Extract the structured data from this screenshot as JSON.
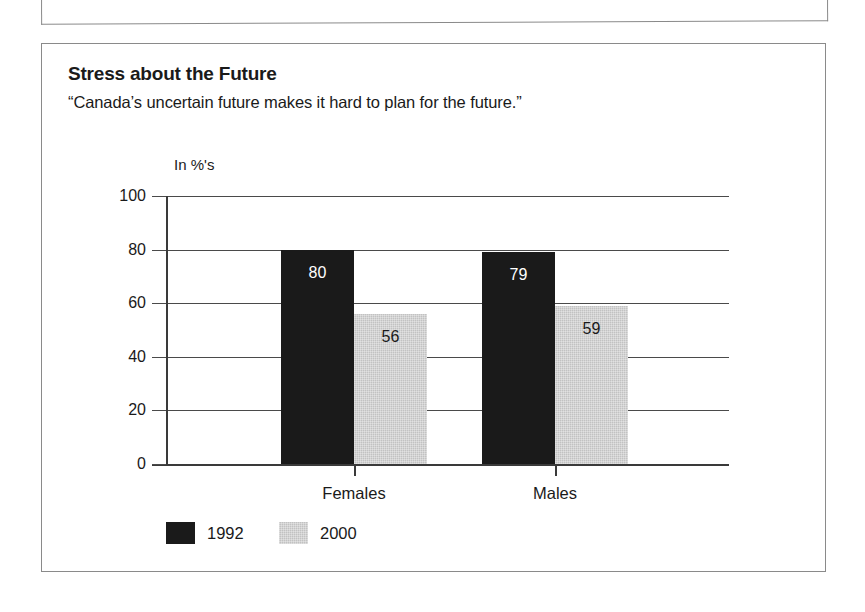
{
  "panel": {
    "title": "Stress about the Future",
    "subtitle": "“Canada’s uncertain future makes it hard to plan for the future.”"
  },
  "colors": {
    "series_1992": "#1a1a1a",
    "series_2000": "#c2c2c2",
    "axis": "#3a3a3a",
    "gridline": "#4a4a4a",
    "panel_border": "#8a8a8a",
    "background": "#ffffff"
  },
  "chart_data": {
    "type": "bar",
    "title": "Stress about the Future",
    "subtitle": "“Canada’s uncertain future makes it hard to plan for the future.”",
    "xlabel": "",
    "ylabel": "In %'s",
    "unit_label": "In %'s",
    "categories": [
      "Females",
      "Males"
    ],
    "series": [
      {
        "name": "1992",
        "values": [
          80,
          79
        ],
        "color": "#1a1a1a"
      },
      {
        "name": "2000",
        "values": [
          56,
          59
        ],
        "color": "#c2c2c2"
      }
    ],
    "ylim": [
      0,
      100
    ],
    "yticks": [
      0,
      20,
      40,
      60,
      80,
      100
    ],
    "ytick_labels": [
      "0",
      "20",
      "40",
      "60",
      "80",
      "100"
    ],
    "grid": true,
    "grid_axis": "y",
    "legend": true,
    "legend_position": "bottom-left",
    "value_labels": true,
    "data_labels": [
      {
        "category": "Females",
        "series": "1992",
        "value": 80,
        "text": "80"
      },
      {
        "category": "Females",
        "series": "2000",
        "value": 56,
        "text": "56"
      },
      {
        "category": "Males",
        "series": "1992",
        "value": 79,
        "text": "79"
      },
      {
        "category": "Males",
        "series": "2000",
        "value": 59,
        "text": "59"
      }
    ]
  }
}
